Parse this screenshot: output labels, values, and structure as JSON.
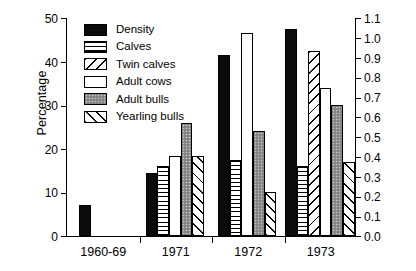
{
  "chart_data": {
    "type": "bar",
    "title": "",
    "xlabel": "",
    "ylabel": "Percentage",
    "ylabel_right": "",
    "categories": [
      "1960-69",
      "1971",
      "1972",
      "1973"
    ],
    "ylim": [
      0,
      50
    ],
    "yticks": [
      0,
      10,
      20,
      30,
      40,
      50
    ],
    "ytick_labels": [
      "0",
      "10",
      "20",
      "30",
      "40",
      "50"
    ],
    "ylim_right": [
      0.0,
      1.1
    ],
    "yticks_right": [
      0.0,
      0.1,
      0.2,
      0.3,
      0.4,
      0.5,
      0.6,
      0.7,
      0.8,
      0.9,
      1.0,
      1.1
    ],
    "ytick_labels_right": [
      "0.0",
      "0.1",
      "0.2",
      "0.3",
      "0.4",
      "0.5",
      "0.6",
      "0.7",
      "0.8",
      "0.9",
      "1.0",
      "1.1"
    ],
    "grid": false,
    "legend_position": "upper-left-inside",
    "series": [
      {
        "name": "Density",
        "pattern": "solid",
        "axis": "right",
        "values": [
          0.15,
          0.31,
          0.91,
          1.04
        ]
      },
      {
        "name": "Calves",
        "pattern": "hline",
        "axis": "left",
        "values": [
          null,
          16.0,
          17.5,
          16.0
        ]
      },
      {
        "name": "Twin calves",
        "pattern": "dbackslash",
        "axis": "left",
        "values": [
          null,
          null,
          null,
          42.5
        ]
      },
      {
        "name": "Adult cows",
        "pattern": "empty",
        "axis": "left",
        "values": [
          null,
          18.3,
          46.5,
          34.0
        ]
      },
      {
        "name": "Adult bulls",
        "pattern": "gray",
        "axis": "left",
        "values": [
          null,
          26.0,
          24.0,
          30.0
        ]
      },
      {
        "name": "Yearling bulls",
        "pattern": "dslash",
        "axis": "left",
        "values": [
          null,
          18.3,
          10.0,
          17.0
        ]
      }
    ],
    "series_percent_equivalent": {
      "note": "Density drawn against right-hand axis (0.0-1.1); bar heights shown as percentage-scale equivalents",
      "Density": [
        7.0,
        14.5,
        41.5,
        47.5
      ]
    }
  },
  "legend": {
    "items": [
      {
        "label": "Density",
        "pattern": "solid"
      },
      {
        "label": "Calves",
        "pattern": "hline"
      },
      {
        "label": "Twin calves",
        "pattern": "dbackslash"
      },
      {
        "label": "Adult cows",
        "pattern": "empty"
      },
      {
        "label": "Adult bulls",
        "pattern": "gray"
      },
      {
        "label": "Yearling bulls",
        "pattern": "dslash"
      }
    ]
  },
  "colors": {
    "axis": "#000000",
    "solid": "#0d0a0a",
    "gray": "#8f8f8f",
    "background": "#ffffff"
  }
}
